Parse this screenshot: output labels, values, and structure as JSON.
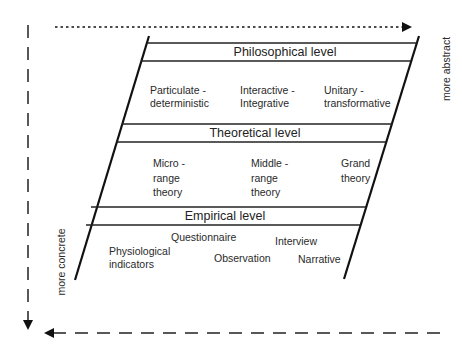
{
  "diagram": {
    "axes": {
      "right_label": "more abstract",
      "left_label": "more concrete"
    },
    "levels": [
      {
        "title": "Philosophical level",
        "items": [
          {
            "lines": [
              "Particulate -",
              "deterministic"
            ]
          },
          {
            "lines": [
              "Interactive -",
              "Integrative"
            ]
          },
          {
            "lines": [
              "Unitary -",
              "transformative"
            ]
          }
        ]
      },
      {
        "title": "Theoretical level",
        "items": [
          {
            "lines": [
              "Micro -",
              "range",
              "theory"
            ]
          },
          {
            "lines": [
              "Middle -",
              "range",
              "theory"
            ]
          },
          {
            "lines": [
              "Grand",
              "theory"
            ]
          }
        ]
      },
      {
        "title": "Empirical level",
        "items": [
          {
            "lines": [
              "Physiological",
              "indicators"
            ]
          },
          {
            "lines": [
              "Questionnaire"
            ]
          },
          {
            "lines": [
              "Observation"
            ]
          },
          {
            "lines": [
              "Interview"
            ]
          },
          {
            "lines": [
              "Narrative"
            ]
          }
        ]
      }
    ],
    "colors": {
      "line": "#111111",
      "text": "#2a2a2a",
      "background": "#ffffff"
    }
  }
}
